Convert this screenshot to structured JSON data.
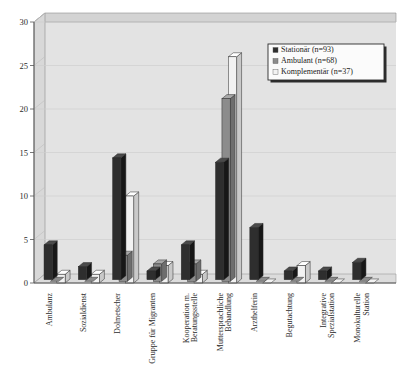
{
  "chart_data": {
    "type": "bar",
    "title": "",
    "subtitle": "",
    "xlabel": "",
    "ylabel": "",
    "ylim": [
      0,
      30
    ],
    "ytick_values": [
      0,
      5,
      10,
      15,
      20,
      25,
      30
    ],
    "ytick_labels": [
      "0",
      "5",
      "10",
      "15",
      "20",
      "25",
      "30"
    ],
    "grid": true,
    "grid_axis": "y",
    "three_d": true,
    "legend_position": "top-right",
    "categories": [
      "Ambulanz",
      "Sozialdienst",
      "Dolmetscher",
      "Gruppe für Migranten",
      "Kooperation m. Beratungsstelle",
      "Muttersprachliche Behandlung",
      "Arzthelferin",
      "Begutachtung",
      "Integrative Spezialstation",
      "Monokulturelle Station"
    ],
    "category_lines": [
      [
        "Ambulanz"
      ],
      [
        "Sozialdienst"
      ],
      [
        "Dolmetscher"
      ],
      [
        "Gruppe für Migranten"
      ],
      [
        "Kooperation m.",
        "Beratungsstelle"
      ],
      [
        "Muttersprachliche",
        "Behandlung"
      ],
      [
        "Arzthelferin"
      ],
      [
        "Begutachtung"
      ],
      [
        "Integrative",
        "Spezialstation"
      ],
      [
        "Monokulturelle",
        "Station"
      ]
    ],
    "series": [
      {
        "name": "Stationär (n=93)",
        "color": "#2e2e2e",
        "side_color": "#171717",
        "top_color": "#4a4a4a",
        "values": [
          4,
          1.5,
          14,
          1,
          4,
          13.5,
          6,
          1,
          1,
          2
        ]
      },
      {
        "name": "Ambulant (n=68)",
        "color": "#8c8c8c",
        "side_color": "#6e6e6e",
        "top_color": "#a8a8a8",
        "values": [
          0,
          0,
          3,
          2,
          2,
          21,
          0,
          0,
          0,
          0
        ]
      },
      {
        "name": "Komplementär (n=37)",
        "color": "#f2f2f2",
        "side_color": "#c9c9c9",
        "top_color": "#ffffff",
        "values": [
          1,
          1,
          10,
          2,
          1,
          26,
          0,
          2,
          0,
          0
        ]
      }
    ]
  },
  "legend": {
    "entries": [
      {
        "label": "Stationär (n=93)",
        "swatch": "#2e2e2e"
      },
      {
        "label": "Ambulant (n=68)",
        "swatch": "#8c8c8c"
      },
      {
        "label": "Komplementär (n=37)",
        "swatch": "#f2f2f2"
      }
    ]
  },
  "colors": {
    "plot_background": "#e8e8e8",
    "wall_background": "#e3e3e3",
    "floor": "#dcdcdc",
    "axis": "#555555",
    "grid": "#cfcfcf",
    "text": "#2b2b2b"
  }
}
